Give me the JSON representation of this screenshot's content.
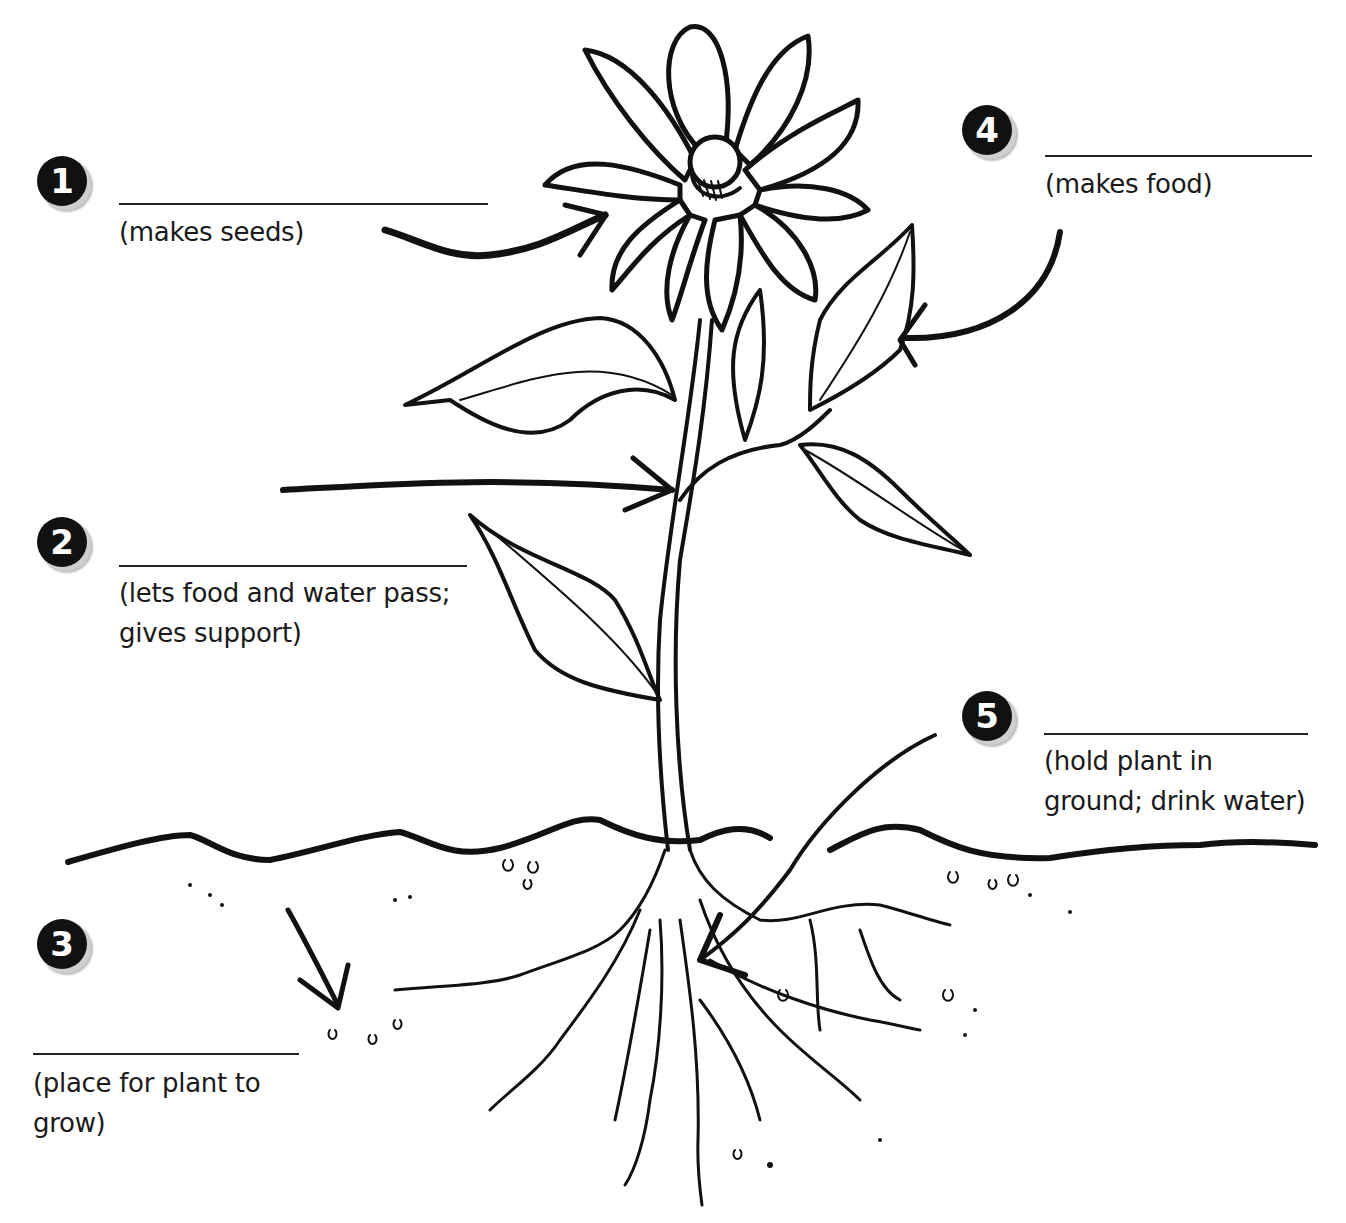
{
  "diagram": {
    "labels": [
      {
        "number": "1",
        "answer_blank": "",
        "hint": "(makes seeds)",
        "points_to": "flower"
      },
      {
        "number": "2",
        "answer_blank": "",
        "hint": "(lets food and water pass;\ngives support)",
        "points_to": "stem"
      },
      {
        "number": "3",
        "answer_blank": "",
        "hint": "(place for plant to\ngrow)",
        "points_to": "soil"
      },
      {
        "number": "4",
        "answer_blank": "",
        "hint": "(makes food)",
        "points_to": "leaf"
      },
      {
        "number": "5",
        "answer_blank": "",
        "hint": "(hold plant in\nground; drink water)",
        "points_to": "roots"
      }
    ],
    "colors": {
      "ink": "#111111",
      "paper": "#ffffff",
      "badge_shadow": "#cfcfcf"
    }
  }
}
